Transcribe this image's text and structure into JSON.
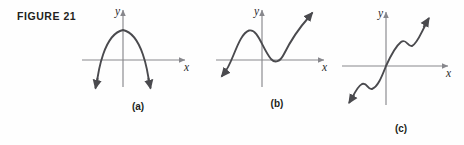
{
  "figure": {
    "label": "FIGURE 21",
    "caption_a": "(a)",
    "caption_b": "(b)",
    "caption_c": "(c)"
  },
  "axes": {
    "x_label": "x",
    "y_label": "y"
  },
  "colors": {
    "background": "#fefefe",
    "curve": "#4a4a4e",
    "axis": "#87878c",
    "text": "#231f20"
  },
  "panels": [
    {
      "id": "a",
      "caption": "(a)",
      "x_axis_label": "x",
      "y_axis_label": "y",
      "description": "Downward-opening parabola with vertex above the x-axis; both ends point down, crossing the x-axis twice.",
      "degree_parity": "even",
      "leading_coefficient_sign": "negative",
      "turning_points": 1,
      "x_intercepts": 2,
      "end_behavior": {
        "left": "down",
        "right": "down"
      }
    },
    {
      "id": "b",
      "caption": "(b)",
      "x_axis_label": "x",
      "y_axis_label": "y",
      "description": "Cubic-like curve rising from lower left to a local maximum left of the y-axis, dipping to a local minimum touching the x-axis right of the origin, then rising to the upper right.",
      "degree_parity": "odd",
      "leading_coefficient_sign": "positive",
      "turning_points": 2,
      "x_intercepts": 2,
      "end_behavior": {
        "left": "down",
        "right": "up"
      }
    },
    {
      "id": "c",
      "caption": "(c)",
      "x_axis_label": "x",
      "y_axis_label": "y",
      "description": "Increasing odd-degree curve with two small wiggles, one below-left of the origin and one above-right; passes through the origin and rises to the upper right.",
      "degree_parity": "odd",
      "leading_coefficient_sign": "positive",
      "turning_points": 4,
      "x_intercepts": 1,
      "end_behavior": {
        "left": "down",
        "right": "up"
      }
    }
  ]
}
